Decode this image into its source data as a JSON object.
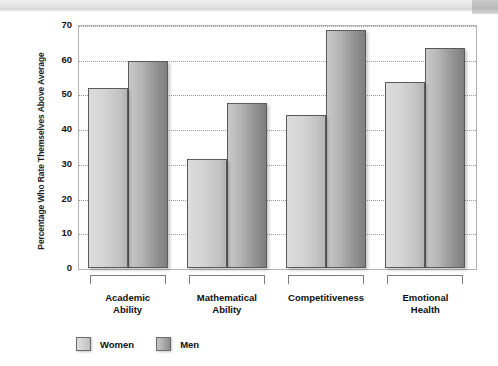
{
  "chart_data": {
    "type": "bar",
    "title": "",
    "subtitle": "",
    "xlabel": "",
    "ylabel": "Percentage Who Rate Themselves Above Average",
    "ylim": [
      0,
      70
    ],
    "ytick_step": 10,
    "yticks": [
      "70",
      "60",
      "50",
      "40",
      "30",
      "20",
      "10",
      "0"
    ],
    "grid": true,
    "grid_axis": "y",
    "grid_style": "dotted",
    "legend_position": "bottom-left",
    "categories": [
      "Academic Ability",
      "Mathematical Ability",
      "Competitiveness",
      "Emotional Health"
    ],
    "category_lines": [
      [
        "Academic",
        "Ability"
      ],
      [
        "Mathematical",
        "Ability"
      ],
      [
        "Competitiveness",
        ""
      ],
      [
        "Emotional",
        "Health"
      ]
    ],
    "series": [
      {
        "name": "Women",
        "color": "#d4d4d4",
        "values": [
          52,
          31.5,
          44,
          53.5
        ]
      },
      {
        "name": "Men",
        "color": "#9a9a9a",
        "values": [
          59.5,
          47.5,
          68.5,
          63.5
        ]
      }
    ]
  },
  "legend": {
    "entries": [
      {
        "label": "Women",
        "swatch": "women"
      },
      {
        "label": "Men",
        "swatch": "men"
      }
    ]
  },
  "colors": {
    "women_light": "#dcdcdc",
    "women_dark": "#b4b4b4",
    "men_light": "#c9c9c9",
    "men_dark": "#7e7e7e",
    "bar_outline": "#5a5a5a",
    "gridline": "#9a9a9a",
    "axis_frame": "#b4b4b4",
    "text": "#0e0e0e"
  }
}
